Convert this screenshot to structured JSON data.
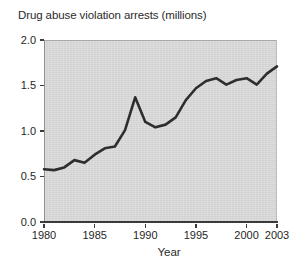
{
  "chart_data": {
    "type": "line",
    "title": "Drug abuse violation arrests (millions)",
    "xlabel": "Year",
    "ylabel": "",
    "xlim": [
      1980,
      2003
    ],
    "ylim": [
      0.0,
      2.0
    ],
    "grid": false,
    "legend": "none",
    "y_ticks": [
      "0.0",
      "0.5",
      "1.0",
      "1.5",
      "2.0"
    ],
    "y_tick_values": [
      0.0,
      0.5,
      1.0,
      1.5,
      2.0
    ],
    "x_ticks": [
      "1980",
      "1985",
      "1990",
      "1995",
      "2000",
      "2003"
    ],
    "x_tick_values": [
      1980,
      1985,
      1990,
      1995,
      2000,
      2003
    ],
    "x": [
      1980,
      1981,
      1982,
      1983,
      1984,
      1985,
      1986,
      1987,
      1988,
      1989,
      1990,
      1991,
      1992,
      1993,
      1994,
      1995,
      1996,
      1997,
      1998,
      1999,
      2000,
      2001,
      2002,
      2003
    ],
    "values": [
      0.58,
      0.57,
      0.6,
      0.68,
      0.65,
      0.74,
      0.81,
      0.83,
      1.01,
      1.37,
      1.1,
      1.04,
      1.07,
      1.15,
      1.34,
      1.47,
      1.55,
      1.58,
      1.51,
      1.56,
      1.58,
      1.51,
      1.63,
      1.71
    ],
    "series": [
      {
        "name": "Drug abuse violation arrests",
        "values": [
          0.58,
          0.57,
          0.6,
          0.68,
          0.65,
          0.74,
          0.81,
          0.83,
          1.01,
          1.37,
          1.1,
          1.04,
          1.07,
          1.15,
          1.34,
          1.47,
          1.55,
          1.58,
          1.51,
          1.56,
          1.58,
          1.51,
          1.63,
          1.71
        ],
        "color": "#2e2e2e"
      }
    ],
    "annotations": [],
    "colors": {
      "plot_background": "#d6d6d6",
      "line": "#2e2e2e",
      "axis": "#3a3a3a",
      "text": "#1f1f1f",
      "figure_background": "#ffffff"
    }
  }
}
